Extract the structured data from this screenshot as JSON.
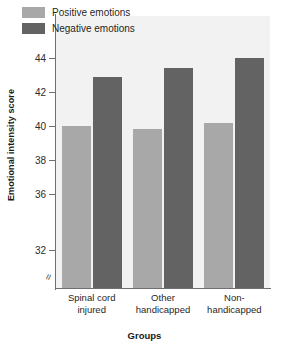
{
  "chart_data": {
    "type": "bar",
    "title": "",
    "xlabel": "Groups",
    "ylabel": "Emotional intensity score",
    "categories": [
      "Spinal cord injured",
      "Other handicapped",
      "Non-handicapped"
    ],
    "category_lines": [
      [
        "Spinal cord",
        "injured"
      ],
      [
        "Other",
        "handicapped"
      ],
      [
        "Non-",
        "handicapped"
      ]
    ],
    "series": [
      {
        "name": "Positive emotions",
        "color": "#a8a8a8",
        "values": [
          40.0,
          39.8,
          40.2
        ]
      },
      {
        "name": "Negative emotions",
        "color": "#636363",
        "values": [
          42.9,
          43.4,
          44.0
        ]
      }
    ],
    "ylim": [
      32,
      45
    ],
    "yticks": [
      32,
      36,
      38,
      40,
      42,
      44
    ],
    "ytick_labels": [
      "32",
      "36",
      "38",
      "40",
      "42",
      "44"
    ],
    "axis_break": true,
    "axis_break_symbol": "≈",
    "grid": false,
    "legend_position": "top-left"
  },
  "legend": {
    "items": [
      {
        "label": "Positive emotions"
      },
      {
        "label": "Negative emotions"
      }
    ]
  },
  "axes": {
    "y_title": "Emotional intensity score",
    "x_title": "Groups"
  }
}
